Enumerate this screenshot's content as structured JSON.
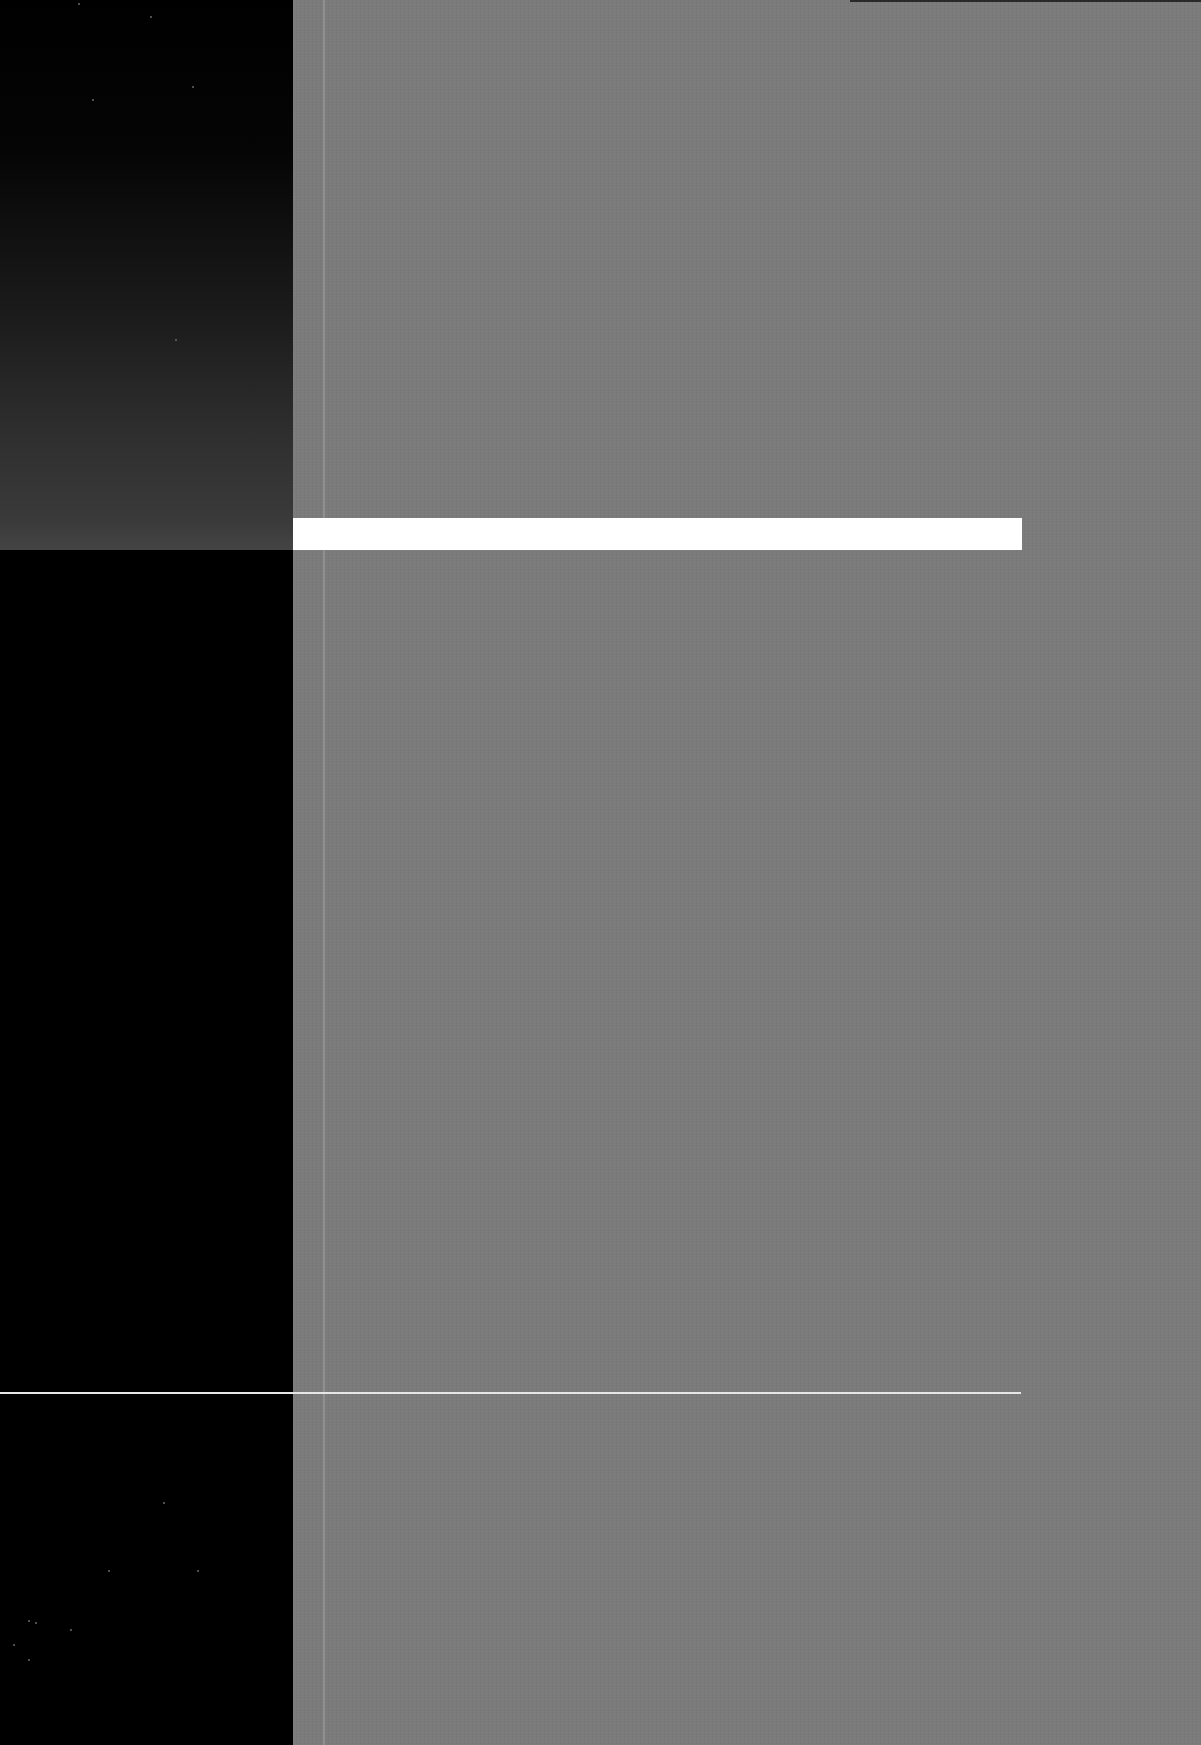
{
  "cover": {
    "text": [],
    "colors": {
      "left_band": "#000000",
      "field": "#7b7b7b",
      "bar": "#ffffff",
      "rule": "#e6e6e6",
      "vertical_rule": "#8f8f8f"
    }
  }
}
